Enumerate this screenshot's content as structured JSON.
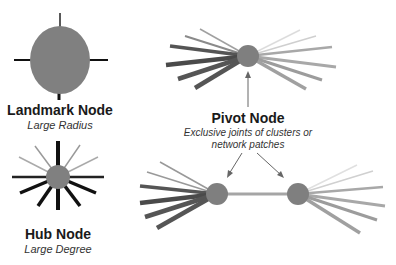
{
  "landmark": {
    "title": "Landmark Node",
    "subtitle": "Large Radius"
  },
  "hub": {
    "title": "Hub Node",
    "subtitle": "Large Degree"
  },
  "pivot": {
    "title": "Pivot Node",
    "subtitle_line1": "Exclusive joints of clusters or",
    "subtitle_line2": "network patches"
  },
  "colors": {
    "node_fill": "#7f7f7f",
    "dark_edge": "#111111",
    "mid_edge": "#6b6b6b",
    "light_edge": "#b5b5b5",
    "arrow": "#666666"
  }
}
